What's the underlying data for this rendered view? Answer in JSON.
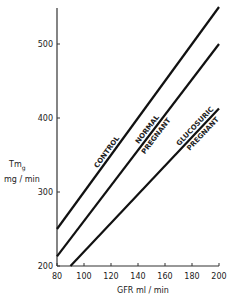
{
  "chart_data": {
    "type": "line",
    "title": "",
    "xlabel": "GFR ml / min",
    "ylabel": "Tmg mg / min",
    "ylabel_main": "Tm",
    "ylabel_sub": "g",
    "ylabel_units": "mg / min",
    "xlim": [
      80,
      200
    ],
    "ylim": [
      200,
      560
    ],
    "x_ticks": [
      "80",
      "100",
      "120",
      "140",
      "160",
      "180",
      "200"
    ],
    "y_ticks": [
      "200",
      "300",
      "400",
      "500"
    ],
    "grid": false,
    "legend": "inline labels along lines",
    "series": [
      {
        "name": "CONTROL",
        "label_lines": [
          "CONTROL"
        ],
        "x": [
          80,
          200
        ],
        "y": [
          250,
          550
        ]
      },
      {
        "name": "NORMAL PREGNANT",
        "label_lines": [
          "NORMAL",
          "PREGNANT"
        ],
        "x": [
          80,
          200
        ],
        "y": [
          213,
          500
        ]
      },
      {
        "name": "GLUCOSURIC PREGNANT",
        "label_lines": [
          "GLUCOSURIC",
          "PREGNANT"
        ],
        "x": [
          90,
          200
        ],
        "y": [
          200,
          413
        ]
      }
    ]
  }
}
